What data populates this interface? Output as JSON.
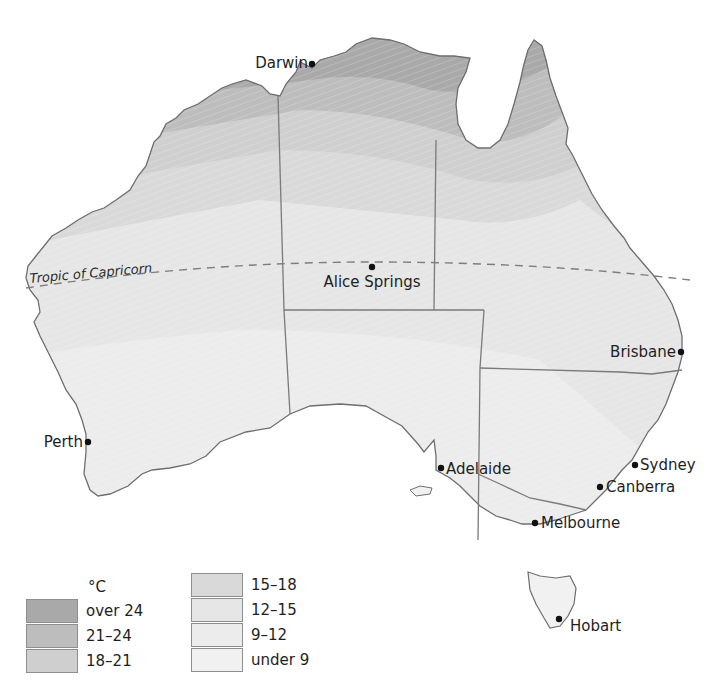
{
  "map": {
    "subject": "Australia mean annual temperature",
    "tropic_label": "Tropic of Capricorn",
    "cities": [
      {
        "name": "Darwin",
        "x": 312,
        "y": 64,
        "label_side": "left"
      },
      {
        "name": "Alice Springs",
        "x": 372,
        "y": 267,
        "label_side": "below"
      },
      {
        "name": "Brisbane",
        "x": 681,
        "y": 352,
        "label_side": "left"
      },
      {
        "name": "Perth",
        "x": 88,
        "y": 442,
        "label_side": "left"
      },
      {
        "name": "Adelaide",
        "x": 441,
        "y": 468,
        "label_side": "right"
      },
      {
        "name": "Sydney",
        "x": 635,
        "y": 465,
        "label_side": "right"
      },
      {
        "name": "Canberra",
        "x": 600,
        "y": 487,
        "label_side": "right"
      },
      {
        "name": "Melbourne",
        "x": 535,
        "y": 523,
        "label_side": "right"
      },
      {
        "name": "Hobart",
        "x": 559,
        "y": 619,
        "label_side": "right"
      }
    ]
  },
  "legend": {
    "unit": "°C",
    "items": [
      {
        "label": "over 24",
        "color": "#a9a9a9"
      },
      {
        "label": "21–24",
        "color": "#bdbdbd"
      },
      {
        "label": "18–21",
        "color": "#cfcfcf"
      },
      {
        "label": "15–18",
        "color": "#d9d9d9"
      },
      {
        "label": "12–15",
        "color": "#e6e6e6"
      },
      {
        "label": "9–12",
        "color": "#ececec"
      },
      {
        "label": "under 9",
        "color": "#f1f1f1"
      }
    ]
  },
  "colors": {
    "coast": "#6e6e6e",
    "border": "#7a7a7a",
    "city_dot": "#111111"
  }
}
